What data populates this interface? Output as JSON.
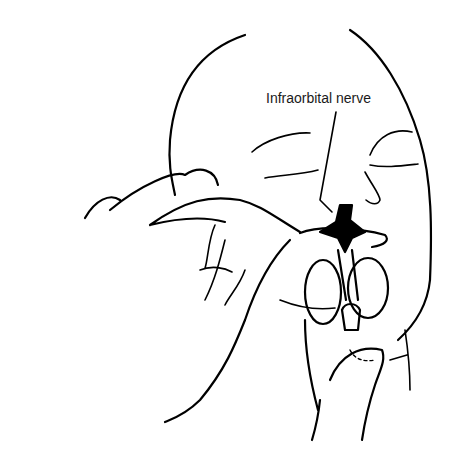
{
  "figure": {
    "labels": [
      {
        "text": "Infraorbital nerve",
        "points_to": "injection site above the upper lip beside the nose"
      }
    ]
  }
}
